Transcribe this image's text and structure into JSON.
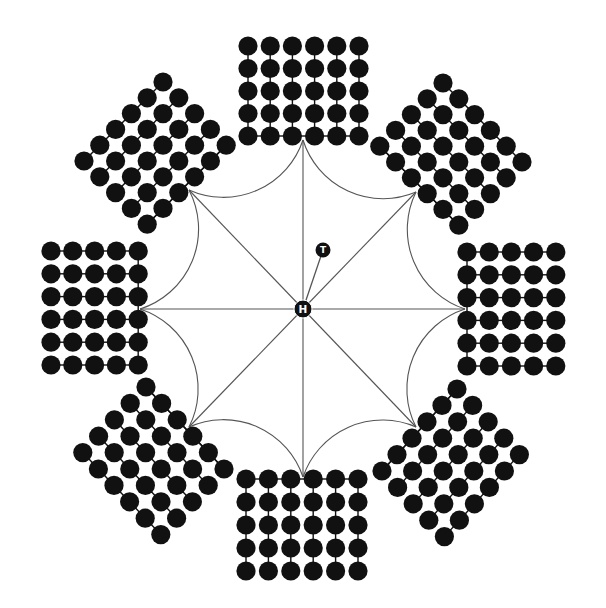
{
  "diagram": {
    "background": "#ffffff",
    "ink": "#111111",
    "line_color": "#555555",
    "center_node": {
      "label": "H",
      "x": 303,
      "y": 309,
      "r": 9
    },
    "tail_node": {
      "label": "T",
      "x": 323,
      "y": 250,
      "r": 7.5
    },
    "dot_radius": 9.6,
    "spacing": 22.3,
    "anchors": [
      {
        "name": "top",
        "x": 303,
        "y": 140
      },
      {
        "name": "upper-right",
        "x": 416,
        "y": 192
      },
      {
        "name": "right",
        "x": 465,
        "y": 309
      },
      {
        "name": "lower-right",
        "x": 416,
        "y": 427
      },
      {
        "name": "bottom",
        "x": 303,
        "y": 477
      },
      {
        "name": "lower-left",
        "x": 189,
        "y": 427
      },
      {
        "name": "left",
        "x": 140,
        "y": 309
      },
      {
        "name": "upper-left",
        "x": 189,
        "y": 190
      }
    ],
    "arc_radius": 84,
    "grids": [
      {
        "name": "top",
        "type": "rect",
        "origin": [
          248,
          46
        ],
        "cols": 6,
        "rows": 5,
        "dx": [
          22.2,
          0
        ],
        "dy": [
          0,
          22.5
        ],
        "link": "vertical",
        "edge": "last-row"
      },
      {
        "name": "bottom",
        "type": "rect",
        "origin": [
          246,
          479
        ],
        "cols": 6,
        "rows": 5,
        "dx": [
          22.4,
          0
        ],
        "dy": [
          0,
          23.0
        ],
        "link": "vertical",
        "edge": "first-row"
      },
      {
        "name": "left",
        "type": "rect",
        "origin": [
          51,
          251
        ],
        "cols": 5,
        "rows": 6,
        "dx": [
          21.8,
          0
        ],
        "dy": [
          0,
          22.8
        ],
        "link": "horizontal",
        "edge": "last-col"
      },
      {
        "name": "right",
        "type": "rect",
        "origin": [
          467,
          252
        ],
        "cols": 5,
        "rows": 6,
        "dx": [
          22.2,
          0
        ],
        "dy": [
          0,
          22.8
        ],
        "link": "horizontal",
        "edge": "first-col"
      },
      {
        "name": "upper-left",
        "type": "diamond",
        "origin": [
          163,
          82
        ],
        "cols": 5,
        "rows": 6,
        "dx": [
          15.8,
          15.8
        ],
        "dy": [
          -15.8,
          15.8
        ],
        "link": "rows",
        "edge": "last-col"
      },
      {
        "name": "upper-right",
        "type": "diamond",
        "origin": [
          443,
          83
        ],
        "cols": 6,
        "rows": 5,
        "dx": [
          15.8,
          15.8
        ],
        "dy": [
          -15.8,
          15.8
        ],
        "link": "cols",
        "edge": "last-row"
      },
      {
        "name": "lower-right",
        "type": "diamond",
        "origin": [
          457,
          389
        ],
        "cols": 5,
        "rows": 6,
        "dx": [
          15.6,
          16.4
        ],
        "dy": [
          -15.0,
          16.4
        ],
        "link": "rows",
        "edge": "first-col"
      },
      {
        "name": "lower-left",
        "type": "diamond",
        "origin": [
          146,
          387
        ],
        "cols": 6,
        "rows": 5,
        "dx": [
          15.6,
          16.4
        ],
        "dy": [
          -15.8,
          16.4
        ],
        "link": "cols",
        "edge": "first-row"
      }
    ]
  }
}
